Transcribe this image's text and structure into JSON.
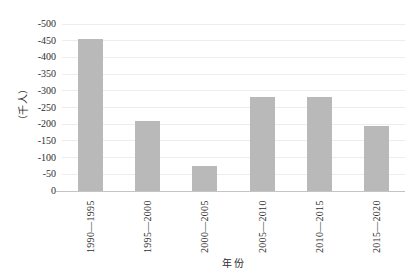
{
  "chart_data": {
    "type": "bar",
    "categories": [
      "1990—1995",
      "1995—2000",
      "2000—2005",
      "2005—2010",
      "2010—2015",
      "2015—2020"
    ],
    "values": [
      -455,
      -210,
      -75,
      -280,
      -280,
      -195
    ],
    "xlabel": "年份",
    "ylabel": "（千人）",
    "ylim": [
      0,
      -500
    ],
    "yticks": [
      -500,
      -450,
      -400,
      -350,
      -300,
      -250,
      -200,
      -150,
      -100,
      -50,
      0
    ],
    "ytick_labels": [
      "-500",
      "-450",
      "-400",
      "-350",
      "-300",
      "-250",
      "-200",
      "-150",
      "-100",
      "-50",
      "0"
    ],
    "grid": true,
    "legend": false,
    "bar_color": "#b9b9b9",
    "grid_color": "#ededed",
    "axis_line_color": "#c4c4c4",
    "text_color": "#2e2e2e"
  }
}
